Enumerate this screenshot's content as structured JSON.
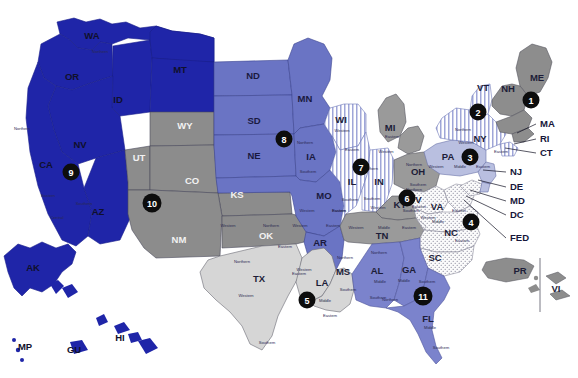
{
  "map": {
    "title": "Geographic Boundaries of United States Courts of Appeals and United States District Courts",
    "background_color": "#ffffff",
    "badge_color": "#0d0d0d",
    "badge_text_color": "#ffffff",
    "border_color": "#2b2b55"
  },
  "circuits": [
    {
      "number": "1",
      "fill": "#8d8d8d",
      "pattern": "solid",
      "badge_x": 531,
      "badge_y": 100,
      "states": [
        "ME",
        "NH",
        "MA",
        "RI",
        "PR"
      ]
    },
    {
      "number": "2",
      "fill": "#ffffff",
      "pattern": "vertical-stripes",
      "badge_x": 478,
      "badge_y": 112,
      "states": [
        "VT",
        "NY",
        "CT"
      ]
    },
    {
      "number": "3",
      "fill": "#b9bfe0",
      "pattern": "solid",
      "badge_x": 470,
      "badge_y": 157,
      "states": [
        "PA",
        "NJ",
        "DE",
        "VI"
      ]
    },
    {
      "number": "4",
      "fill": "#fbfbfb",
      "pattern": "dots",
      "badge_x": 471,
      "badge_y": 222,
      "states": [
        "MD",
        "WV",
        "VA",
        "NC",
        "SC"
      ]
    },
    {
      "number": "5",
      "fill": "#d6d6d6",
      "pattern": "solid",
      "badge_x": 307,
      "badge_y": 300,
      "states": [
        "TX",
        "LA",
        "MS"
      ]
    },
    {
      "number": "6",
      "fill": "#9a9a9a",
      "pattern": "solid",
      "badge_x": 407,
      "badge_y": 198,
      "states": [
        "MI",
        "OH",
        "KY",
        "TN"
      ]
    },
    {
      "number": "7",
      "fill": "#ffffff",
      "pattern": "vertical-stripes",
      "badge_x": 361,
      "badge_y": 167,
      "states": [
        "WI",
        "IL",
        "IN"
      ]
    },
    {
      "number": "8",
      "fill": "#6a74c4",
      "pattern": "solid",
      "badge_x": 284,
      "badge_y": 139,
      "states": [
        "ND",
        "SD",
        "NE",
        "MN",
        "IA",
        "MO",
        "AR"
      ]
    },
    {
      "number": "9",
      "fill": "#1f25a8",
      "pattern": "solid",
      "badge_x": 71,
      "badge_y": 172,
      "states": [
        "WA",
        "OR",
        "ID",
        "MT",
        "NV",
        "CA",
        "AZ",
        "AK",
        "HI",
        "GU",
        "MP"
      ]
    },
    {
      "number": "10",
      "fill": "#8c8c8c",
      "pattern": "solid",
      "badge_x": 152,
      "badge_y": 203,
      "states": [
        "WY",
        "UT",
        "CO",
        "KS",
        "NM",
        "OK"
      ]
    },
    {
      "number": "11",
      "fill": "#7b83cc",
      "pattern": "solid",
      "badge_x": 423,
      "badge_y": 296,
      "states": [
        "AL",
        "GA",
        "FL"
      ]
    }
  ],
  "states": [
    {
      "abbr": "WA",
      "x": 92,
      "y": 36,
      "tone": "on-dark"
    },
    {
      "abbr": "OR",
      "x": 72,
      "y": 77,
      "tone": "on-dark"
    },
    {
      "abbr": "MT",
      "x": 180,
      "y": 70,
      "tone": "on-dark"
    },
    {
      "abbr": "ID",
      "x": 118,
      "y": 100,
      "tone": "on-dark"
    },
    {
      "abbr": "NV",
      "x": 80,
      "y": 145,
      "tone": "on-dark"
    },
    {
      "abbr": "CA",
      "x": 46,
      "y": 165,
      "tone": "on-dark"
    },
    {
      "abbr": "AZ",
      "x": 98,
      "y": 212,
      "tone": "on-dark"
    },
    {
      "abbr": "WY",
      "x": 185,
      "y": 126,
      "tone": "on-gray"
    },
    {
      "abbr": "UT",
      "x": 139,
      "y": 158,
      "tone": "on-gray"
    },
    {
      "abbr": "CO",
      "x": 192,
      "y": 181,
      "tone": "on-gray"
    },
    {
      "abbr": "KS",
      "x": 237,
      "y": 195,
      "tone": "on-gray"
    },
    {
      "abbr": "NM",
      "x": 179,
      "y": 240,
      "tone": "on-gray"
    },
    {
      "abbr": "OK",
      "x": 266,
      "y": 236,
      "tone": "on-gray"
    },
    {
      "abbr": "ND",
      "x": 253,
      "y": 76,
      "tone": "on-blue"
    },
    {
      "abbr": "SD",
      "x": 254,
      "y": 121,
      "tone": "on-blue"
    },
    {
      "abbr": "NE",
      "x": 254,
      "y": 156,
      "tone": "on-blue"
    },
    {
      "abbr": "MN",
      "x": 305,
      "y": 99,
      "tone": "on-blue"
    },
    {
      "abbr": "IA",
      "x": 311,
      "y": 157,
      "tone": "on-blue"
    },
    {
      "abbr": "MO",
      "x": 324,
      "y": 196,
      "tone": "on-blue"
    },
    {
      "abbr": "AR",
      "x": 320,
      "y": 243,
      "tone": "on-blue"
    },
    {
      "abbr": "WI",
      "x": 341,
      "y": 120,
      "tone": "on-light"
    },
    {
      "abbr": "IL",
      "x": 352,
      "y": 182,
      "tone": "on-light"
    },
    {
      "abbr": "IN",
      "x": 379,
      "y": 182,
      "tone": "on-light"
    },
    {
      "abbr": "MI",
      "x": 390,
      "y": 128,
      "tone": "on-light"
    },
    {
      "abbr": "OH",
      "x": 418,
      "y": 172,
      "tone": "on-light"
    },
    {
      "abbr": "KY",
      "x": 400,
      "y": 205,
      "tone": "on-light"
    },
    {
      "abbr": "TN",
      "x": 382,
      "y": 236,
      "tone": "on-light"
    },
    {
      "abbr": "MS",
      "x": 343,
      "y": 272,
      "tone": "on-light"
    },
    {
      "abbr": "LA",
      "x": 322,
      "y": 283,
      "tone": "on-light"
    },
    {
      "abbr": "TX",
      "x": 259,
      "y": 279,
      "tone": "on-light"
    },
    {
      "abbr": "AL",
      "x": 377,
      "y": 271,
      "tone": "on-light"
    },
    {
      "abbr": "GA",
      "x": 409,
      "y": 270,
      "tone": "on-light"
    },
    {
      "abbr": "FL",
      "x": 428,
      "y": 319,
      "tone": "on-light"
    },
    {
      "abbr": "SC",
      "x": 435,
      "y": 258,
      "tone": "on-light"
    },
    {
      "abbr": "NC",
      "x": 451,
      "y": 233,
      "tone": "on-light"
    },
    {
      "abbr": "VA",
      "x": 437,
      "y": 207,
      "tone": "on-light"
    },
    {
      "abbr": "WV",
      "x": 414,
      "y": 200,
      "tone": "on-light"
    },
    {
      "abbr": "PA",
      "x": 448,
      "y": 157,
      "tone": "on-light"
    },
    {
      "abbr": "NY",
      "x": 480,
      "y": 139,
      "tone": "on-light"
    },
    {
      "abbr": "VT",
      "x": 483,
      "y": 88,
      "tone": "on-light"
    },
    {
      "abbr": "NH",
      "x": 508,
      "y": 89,
      "tone": "on-light"
    },
    {
      "abbr": "ME",
      "x": 537,
      "y": 78,
      "tone": "on-light"
    },
    {
      "abbr": "AK",
      "x": 33,
      "y": 268,
      "tone": "on-dark"
    },
    {
      "abbr": "HI",
      "x": 120,
      "y": 338,
      "tone": "on-dark"
    },
    {
      "abbr": "GU",
      "x": 74,
      "y": 350,
      "tone": "on-dark"
    },
    {
      "abbr": "MP",
      "x": 25,
      "y": 347,
      "tone": "on-dark"
    },
    {
      "abbr": "PR",
      "x": 520,
      "y": 271,
      "tone": "on-light"
    },
    {
      "abbr": "VI",
      "x": 556,
      "y": 289,
      "tone": "on-light"
    }
  ],
  "callouts": [
    {
      "label": "MA",
      "x": 540,
      "y": 124,
      "line": [
        [
          536,
          124
        ],
        [
          517,
          133
        ]
      ]
    },
    {
      "label": "RI",
      "x": 540,
      "y": 139,
      "line": [
        [
          536,
          139
        ],
        [
          514,
          144
        ]
      ]
    },
    {
      "label": "CT",
      "x": 540,
      "y": 153,
      "line": [
        [
          536,
          153
        ],
        [
          505,
          148
        ]
      ]
    },
    {
      "label": "NJ",
      "x": 510,
      "y": 172,
      "line": [
        [
          506,
          172
        ],
        [
          483,
          170
        ]
      ]
    },
    {
      "label": "DE",
      "x": 510,
      "y": 187,
      "line": [
        [
          506,
          187
        ],
        [
          478,
          180
        ]
      ]
    },
    {
      "label": "MD",
      "x": 510,
      "y": 201,
      "line": [
        [
          506,
          201
        ],
        [
          470,
          190
        ]
      ]
    },
    {
      "label": "DC",
      "x": 510,
      "y": 215,
      "line": [
        [
          506,
          215
        ],
        [
          466,
          196
        ]
      ]
    },
    {
      "label": "FED",
      "x": 510,
      "y": 238,
      "line": [
        [
          506,
          238
        ],
        [
          464,
          200
        ]
      ]
    }
  ],
  "district_labels": [
    {
      "text": "Northern",
      "x": 22,
      "y": 129
    },
    {
      "text": "Eastern",
      "x": 48,
      "y": 196
    },
    {
      "text": "Northern",
      "x": 100,
      "y": 52
    },
    {
      "text": "Southern",
      "x": 84,
      "y": 204
    },
    {
      "text": "Central",
      "x": 57,
      "y": 218
    },
    {
      "text": "Northern",
      "x": 305,
      "y": 143
    },
    {
      "text": "Southern",
      "x": 308,
      "y": 172
    },
    {
      "text": "Western",
      "x": 307,
      "y": 211
    },
    {
      "text": "Eastern",
      "x": 339,
      "y": 211
    },
    {
      "text": "Western",
      "x": 300,
      "y": 226
    },
    {
      "text": "Eastern",
      "x": 333,
      "y": 226
    },
    {
      "text": "Western",
      "x": 228,
      "y": 226
    },
    {
      "text": "Northern",
      "x": 271,
      "y": 226
    },
    {
      "text": "Eastern",
      "x": 285,
      "y": 247
    },
    {
      "text": "Northern",
      "x": 242,
      "y": 262
    },
    {
      "text": "Eastern",
      "x": 299,
      "y": 274
    },
    {
      "text": "Western",
      "x": 246,
      "y": 296
    },
    {
      "text": "Southern",
      "x": 267,
      "y": 343
    },
    {
      "text": "Western",
      "x": 304,
      "y": 270
    },
    {
      "text": "Middle",
      "x": 325,
      "y": 301
    },
    {
      "text": "Eastern",
      "x": 330,
      "y": 316
    },
    {
      "text": "Northern",
      "x": 345,
      "y": 258
    },
    {
      "text": "Southern",
      "x": 348,
      "y": 290
    },
    {
      "text": "Northern",
      "x": 379,
      "y": 253
    },
    {
      "text": "Middle",
      "x": 380,
      "y": 282
    },
    {
      "text": "Southern",
      "x": 378,
      "y": 298
    },
    {
      "text": "Middle",
      "x": 404,
      "y": 281
    },
    {
      "text": "Southern",
      "x": 427,
      "y": 282
    },
    {
      "text": "Northern",
      "x": 390,
      "y": 300
    },
    {
      "text": "Middle",
      "x": 430,
      "y": 328
    },
    {
      "text": "Southern",
      "x": 441,
      "y": 348
    },
    {
      "text": "Western",
      "x": 342,
      "y": 131
    },
    {
      "text": "Eastern",
      "x": 352,
      "y": 150
    },
    {
      "text": "Southern",
      "x": 350,
      "y": 200
    },
    {
      "text": "Eastern",
      "x": 339,
      "y": 211
    },
    {
      "text": "Northern",
      "x": 370,
      "y": 169
    },
    {
      "text": "Southern",
      "x": 372,
      "y": 199
    },
    {
      "text": "Eastern",
      "x": 392,
      "y": 137
    },
    {
      "text": "Western",
      "x": 386,
      "y": 152
    },
    {
      "text": "Northern",
      "x": 414,
      "y": 165
    },
    {
      "text": "Southern",
      "x": 418,
      "y": 185
    },
    {
      "text": "Western",
      "x": 378,
      "y": 208
    },
    {
      "text": "Eastern",
      "x": 419,
      "y": 207
    },
    {
      "text": "Western",
      "x": 356,
      "y": 228
    },
    {
      "text": "Middle",
      "x": 384,
      "y": 228
    },
    {
      "text": "Eastern",
      "x": 409,
      "y": 228
    },
    {
      "text": "Northern",
      "x": 414,
      "y": 190
    },
    {
      "text": "Southern",
      "x": 411,
      "y": 211
    },
    {
      "text": "Western",
      "x": 428,
      "y": 218
    },
    {
      "text": "Eastern",
      "x": 459,
      "y": 211
    },
    {
      "text": "Middle",
      "x": 438,
      "y": 222
    },
    {
      "text": "Eastern",
      "x": 462,
      "y": 241
    },
    {
      "text": "Western",
      "x": 436,
      "y": 167
    },
    {
      "text": "Middle",
      "x": 460,
      "y": 167
    },
    {
      "text": "Eastern",
      "x": 483,
      "y": 167
    },
    {
      "text": "Northern",
      "x": 463,
      "y": 130
    },
    {
      "text": "Western",
      "x": 466,
      "y": 143
    },
    {
      "text": "Eastern",
      "x": 501,
      "y": 152
    }
  ]
}
